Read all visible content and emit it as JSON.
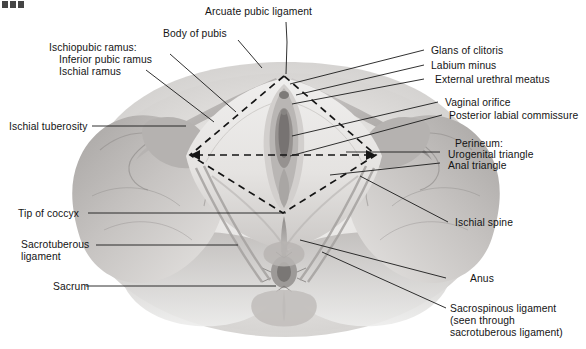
{
  "figure": {
    "corner_mark": "",
    "background_color": "#ffffff",
    "line_color": "#1a1a1a",
    "dashed_color": "#151515",
    "tissue_light": "#e8e6e4",
    "tissue_mid": "#bdbab8",
    "tissue_dark": "#8e8b89"
  },
  "labels": {
    "top": [
      {
        "id": "arcuate-pubic-ligament",
        "text": "Arcuate pubic ligament"
      },
      {
        "id": "body-of-pubis",
        "text": "Body of pubis"
      }
    ],
    "left": [
      {
        "id": "ischiopubic-ramus-heading",
        "text": "Ischiopubic ramus:"
      },
      {
        "id": "inferior-pubic-ramus",
        "text": "Inferior pubic ramus"
      },
      {
        "id": "ischial-ramus",
        "text": "Ischial ramus"
      },
      {
        "id": "ischial-tuberosity",
        "text": "Ischial tuberosity"
      },
      {
        "id": "tip-of-coccyx",
        "text": "Tip of coccyx"
      },
      {
        "id": "sacrotuberous-ligament-line1",
        "text": "Sacrotuberous"
      },
      {
        "id": "sacrotuberous-ligament-line2",
        "text": "ligament"
      },
      {
        "id": "sacrum",
        "text": "Sacrum"
      }
    ],
    "right": [
      {
        "id": "glans-of-clitoris",
        "text": "Glans of clitoris"
      },
      {
        "id": "labium-minus",
        "text": "Labium minus"
      },
      {
        "id": "external-urethral-meatus",
        "text": "External urethral meatus"
      },
      {
        "id": "vaginal-orifice",
        "text": "Vaginal orifice"
      },
      {
        "id": "posterior-labial-commissure",
        "text": "Posterior labial commissure"
      },
      {
        "id": "perineum-heading",
        "text": "Perineum:"
      },
      {
        "id": "urogenital-triangle",
        "text": "Urogenital triangle"
      },
      {
        "id": "anal-triangle",
        "text": "Anal triangle"
      },
      {
        "id": "ischial-spine",
        "text": "Ischial spine"
      },
      {
        "id": "anus",
        "text": "Anus"
      },
      {
        "id": "sacrospinous-ligament-line1",
        "text": "Sacrospinous ligament"
      },
      {
        "id": "sacrospinous-ligament-line2",
        "text": "(seen through"
      },
      {
        "id": "sacrospinous-ligament-line3",
        "text": "sacrotuberous ligament)"
      }
    ]
  },
  "diagram": {
    "diamond": {
      "name": "perineal-diamond",
      "style": "dashed",
      "apex_top": [
        284,
        76
      ],
      "apex_left": [
        190,
        155
      ],
      "apex_right": [
        376,
        155
      ],
      "apex_bottom": [
        283,
        213
      ],
      "transverse_line": {
        "from": [
          190,
          155
        ],
        "to": [
          376,
          155
        ],
        "arrowheads": "both"
      }
    }
  }
}
